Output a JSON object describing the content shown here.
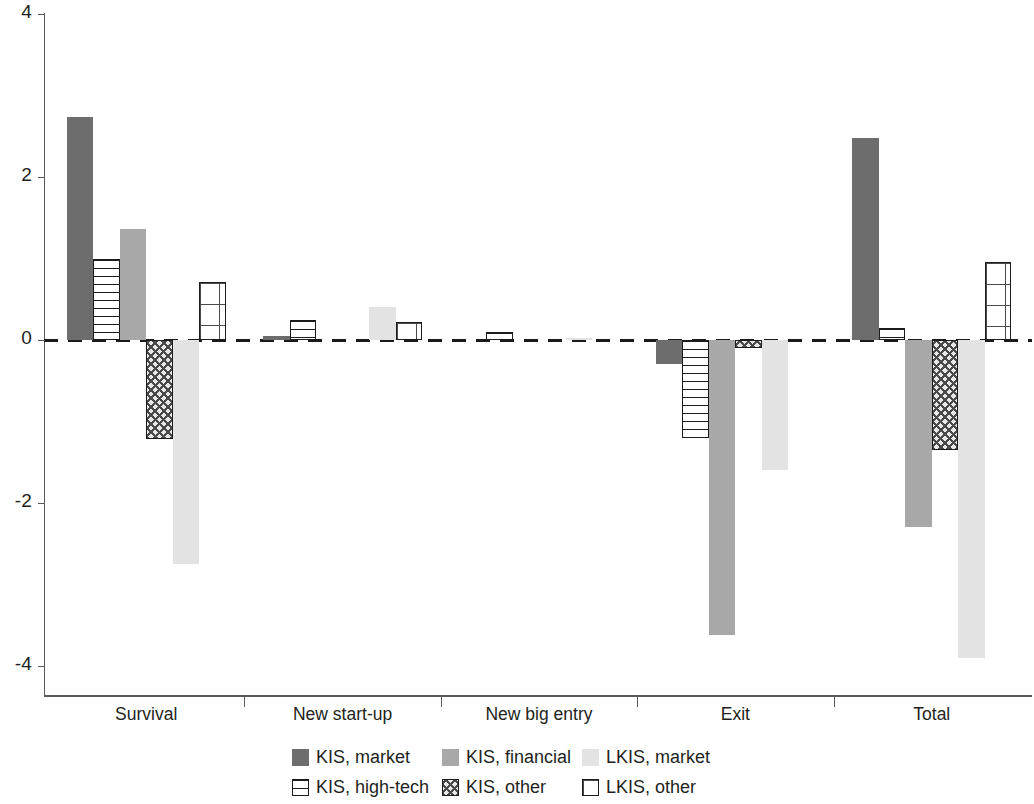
{
  "chart_data": {
    "type": "bar",
    "title": "",
    "xlabel": "",
    "ylabel": "",
    "ylim": [
      -4,
      4
    ],
    "yticks": [
      4,
      2,
      0,
      -2,
      -4
    ],
    "ytick_labels": [
      "4",
      "2",
      "0",
      "-2",
      "-4"
    ],
    "grid": false,
    "zero_line": "dashed",
    "legend_position": "bottom",
    "categories": [
      "Survival",
      "New start-up",
      "New big entry",
      "Exit",
      "Total"
    ],
    "series": [
      {
        "name": "KIS, market",
        "pattern": "solid-dark-gray",
        "color": "#6d6d6d",
        "values": [
          2.74,
          0.05,
          0.0,
          -0.3,
          2.48
        ]
      },
      {
        "name": "KIS, high-tech",
        "pattern": "horizontal-lines",
        "color": "#ffffff",
        "values": [
          1.0,
          0.25,
          0.1,
          -1.2,
          0.15
        ]
      },
      {
        "name": "KIS, financial",
        "pattern": "solid-medium-gray",
        "color": "#a8a8a8",
        "values": [
          1.36,
          0.0,
          0.0,
          -3.62,
          -2.3
        ]
      },
      {
        "name": "KIS, other",
        "pattern": "crosshatch",
        "color": "#e8e8e8",
        "values": [
          -1.22,
          0.0,
          0.0,
          -0.1,
          -1.35
        ]
      },
      {
        "name": "LKIS, market",
        "pattern": "solid-light-gray",
        "color": "#e3e3e3",
        "values": [
          -2.75,
          0.4,
          0.03,
          -1.6,
          -3.9
        ]
      },
      {
        "name": "LKIS, other",
        "pattern": "grid",
        "color": "#ffffff",
        "values": [
          0.71,
          0.22,
          0.0,
          0.0,
          0.96
        ]
      }
    ]
  },
  "legend": {
    "items": [
      {
        "label": "KIS, market",
        "swatch": "kis-market"
      },
      {
        "label": "KIS, financial",
        "swatch": "kis-financial"
      },
      {
        "label": "LKIS, market",
        "swatch": "lkis-market"
      },
      {
        "label": "KIS, high-tech",
        "swatch": "kis-hightech"
      },
      {
        "label": "KIS, other",
        "swatch": "kis-other"
      },
      {
        "label": "LKIS, other",
        "swatch": "lkis-other"
      }
    ]
  }
}
